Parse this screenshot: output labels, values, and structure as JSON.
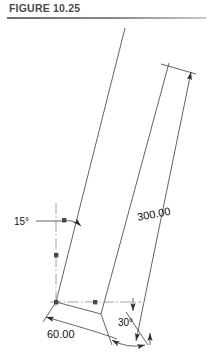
{
  "figure": {
    "title": "FIGURE 10.25"
  },
  "drawing": {
    "dimensions": [
      {
        "id": "length",
        "label": "300.00",
        "kind": "linear"
      },
      {
        "id": "offset",
        "label": "60.00",
        "kind": "linear"
      },
      {
        "id": "angle-from-vertical",
        "label": "15°",
        "kind": "angular"
      },
      {
        "id": "angle-at-base",
        "label": "30°",
        "kind": "angular"
      }
    ],
    "labels": {
      "length": "300.00",
      "offset": "60.00",
      "angle_vertical": "15°",
      "angle_base": "30°"
    },
    "colors": {
      "object_line": "#3c3c3c",
      "dimension_line": "#3c3c3c",
      "center_line": "#8a8a8a",
      "text": "#111111",
      "title_text": "#4a4a4a",
      "background": "#ffffff"
    }
  }
}
